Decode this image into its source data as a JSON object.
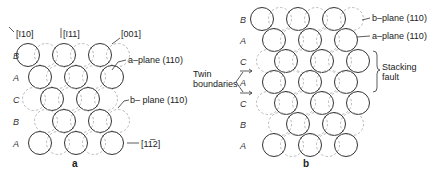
{
  "figure": {
    "panel_a": {
      "caption": "a",
      "directions": [
        "[ī10]",
        "[ī11]",
        "[001]",
        "[11̅2]"
      ],
      "row_labels": [
        "B",
        "A",
        "C",
        "B",
        "A"
      ],
      "annotations": {
        "a_plane": "a–plane (110)",
        "b_plane": "b– plane (110)"
      },
      "rows": [
        {
          "y": 55,
          "solid": [
            28,
            64,
            100
          ],
          "dashed": [
            46,
            82,
            118
          ]
        },
        {
          "y": 77,
          "solid": [
            40,
            76,
            112
          ],
          "dashed": [
            58,
            94
          ]
        },
        {
          "y": 99,
          "solid": [
            52,
            88
          ],
          "dashed": [
            34,
            70,
            106
          ]
        },
        {
          "y": 121,
          "solid": [
            64,
            100
          ],
          "dashed": [
            46,
            82,
            118
          ]
        },
        {
          "y": 143,
          "solid": [
            40,
            76,
            112
          ],
          "dashed": [
            58,
            94
          ]
        }
      ]
    },
    "panel_b": {
      "caption": "b",
      "row_labels": [
        "B",
        "A",
        "C",
        "A",
        "C",
        "B",
        "A"
      ],
      "annotations": {
        "b_plane": "b–plane (110)",
        "a_plane": "a–plane (110)",
        "stacking_fault": [
          "Stacking",
          "fault"
        ],
        "twin_boundaries": [
          "Twin",
          "boundaries"
        ]
      },
      "rows": [
        {
          "y": 19,
          "solid": [
            262,
            298,
            334
          ],
          "dashed": [
            280,
            316,
            352
          ]
        },
        {
          "y": 40,
          "solid": [
            274,
            310,
            346
          ],
          "dashed": [
            292,
            328
          ]
        },
        {
          "y": 61,
          "solid": [
            286,
            322,
            358
          ],
          "dashed": [
            268,
            304,
            340
          ]
        },
        {
          "y": 82,
          "solid": [
            274,
            310,
            346
          ],
          "dashed": [
            292,
            328
          ]
        },
        {
          "y": 103,
          "solid": [
            286,
            322,
            358
          ],
          "dashed": [
            268,
            304,
            340
          ]
        },
        {
          "y": 124,
          "solid": [
            298,
            334
          ],
          "dashed": [
            280,
            316,
            352
          ]
        },
        {
          "y": 145,
          "solid": [
            274,
            310,
            346
          ],
          "dashed": [
            292,
            328
          ]
        }
      ]
    }
  }
}
